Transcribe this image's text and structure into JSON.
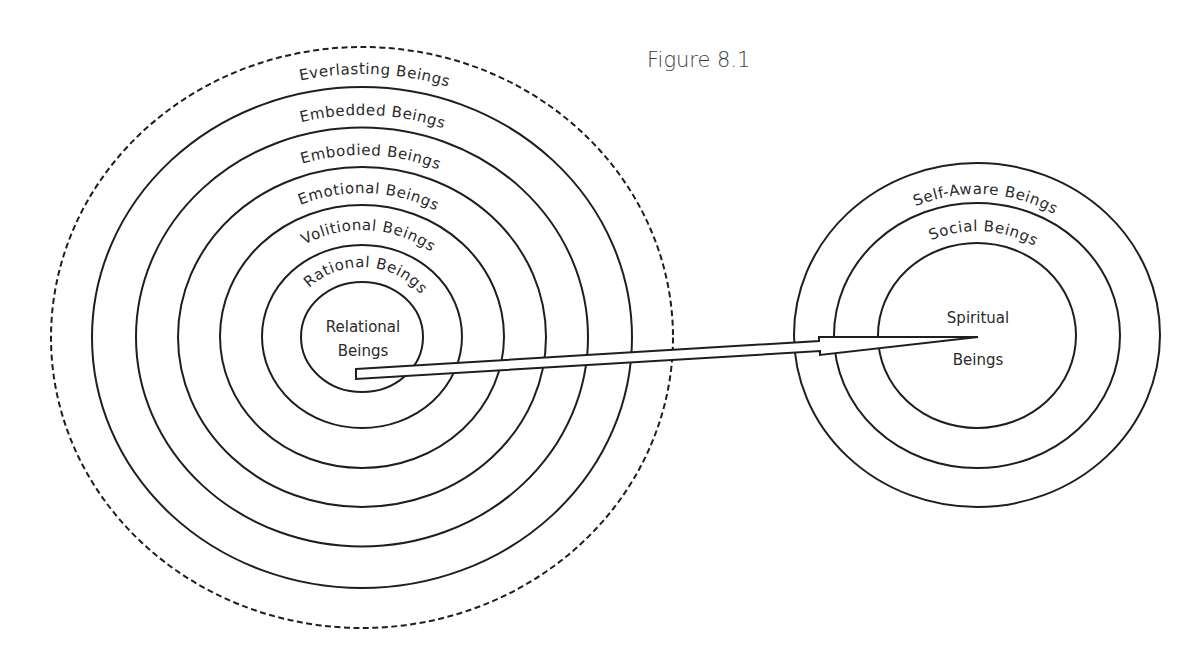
{
  "figure": {
    "title": "Figure 8.1"
  },
  "left_diagram": {
    "description": "Concentric rings of human being dimensions",
    "center_label": {
      "line1": "Relational",
      "line2": "Beings"
    },
    "ring_labels": [
      "Everlasting Beings",
      "Embedded Beings",
      "Embodied Beings",
      "Emotional Beings",
      "Volitional Beings",
      "Rational Beings"
    ],
    "outer_ring_style": "dashed"
  },
  "right_diagram": {
    "center_label": {
      "line1": "Spiritual",
      "line2": "Beings"
    },
    "ring_labels": [
      "Self-Aware Beings",
      "Social Beings"
    ]
  },
  "arrow": {
    "from": "Relational Beings",
    "to": "Spiritual Beings"
  },
  "colors": {
    "line": "#1e1e1e",
    "text": "#2a2a2a",
    "background": "#ffffff"
  }
}
